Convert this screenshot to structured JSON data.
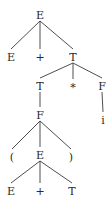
{
  "diagram": {
    "type": "parse-tree",
    "nodes": [
      {
        "id": "n0",
        "label": "E"
      },
      {
        "id": "n1",
        "label": "E",
        "parent": "n0"
      },
      {
        "id": "n2",
        "label": "+",
        "parent": "n0"
      },
      {
        "id": "n3",
        "label": "T",
        "parent": "n0"
      },
      {
        "id": "n4",
        "label": "T",
        "parent": "n3"
      },
      {
        "id": "n5",
        "label": "*",
        "parent": "n3"
      },
      {
        "id": "n6",
        "label": "F",
        "parent": "n3"
      },
      {
        "id": "n7",
        "label": "F",
        "parent": "n4"
      },
      {
        "id": "n8",
        "label": "i",
        "parent": "n6"
      },
      {
        "id": "n9",
        "label": "(",
        "parent": "n7"
      },
      {
        "id": "n10",
        "label": "E",
        "parent": "n7"
      },
      {
        "id": "n11",
        "label": ")",
        "parent": "n7"
      },
      {
        "id": "n12",
        "label": "E",
        "parent": "n10"
      },
      {
        "id": "n13",
        "label": "+",
        "parent": "n10"
      },
      {
        "id": "n14",
        "label": "T",
        "parent": "n10"
      }
    ]
  }
}
